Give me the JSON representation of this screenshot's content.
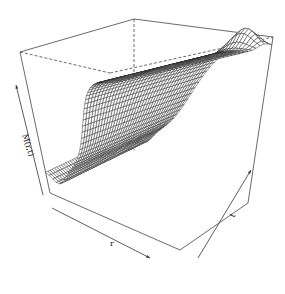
{
  "chart_data": {
    "type": "surface",
    "title": "",
    "xlabel": "r",
    "ylabel": "t",
    "zlabel": "M(r,t)",
    "x_range": [
      0,
      1
    ],
    "y_range": [
      0,
      1
    ],
    "z_range": [
      0,
      1
    ],
    "grid_x_count": 40,
    "grid_y_count": 40,
    "surface_description": "Sigmoid-like rise along r from a low valley near r=0 to a high plateau near r=1; slight bump near t=1 at high r",
    "surface_model": {
      "low_level": 0.15,
      "high_level": 0.95,
      "rise_center_r": 0.45,
      "rise_steepness": 9,
      "valley_dip_r": 0.1,
      "valley_dip_depth": 0.08,
      "edge_bump_t": 0.95,
      "edge_bump_height": 0.12
    },
    "view": {
      "theta_deg": -35,
      "phi_deg": 25
    },
    "line_color": "#222222",
    "box_color": "#444444",
    "background": "#ffffff"
  }
}
